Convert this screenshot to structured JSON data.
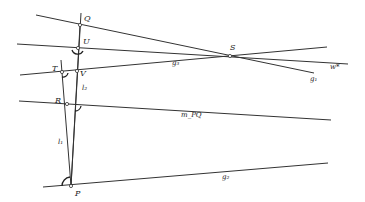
{
  "diagram": {
    "points": [
      {
        "id": "Q",
        "label": "Q",
        "x": 80,
        "y": 25
      },
      {
        "id": "U",
        "label": "U",
        "x": 78,
        "y": 48
      },
      {
        "id": "T",
        "label": "T",
        "x": 62,
        "y": 72
      },
      {
        "id": "V",
        "label": "V",
        "x": 77,
        "y": 71
      },
      {
        "id": "R",
        "label": "R",
        "x": 67,
        "y": 104
      },
      {
        "id": "S",
        "label": "S",
        "x": 230,
        "y": 56
      },
      {
        "id": "P",
        "label": "P",
        "x": 71,
        "y": 186
      }
    ],
    "line_labels": {
      "g3": "g₃",
      "g1": "g₁",
      "w_star": "w*",
      "m_pq": "m_PQ",
      "g2": "g₂",
      "l1": "l₁",
      "l2": "l₂"
    }
  }
}
